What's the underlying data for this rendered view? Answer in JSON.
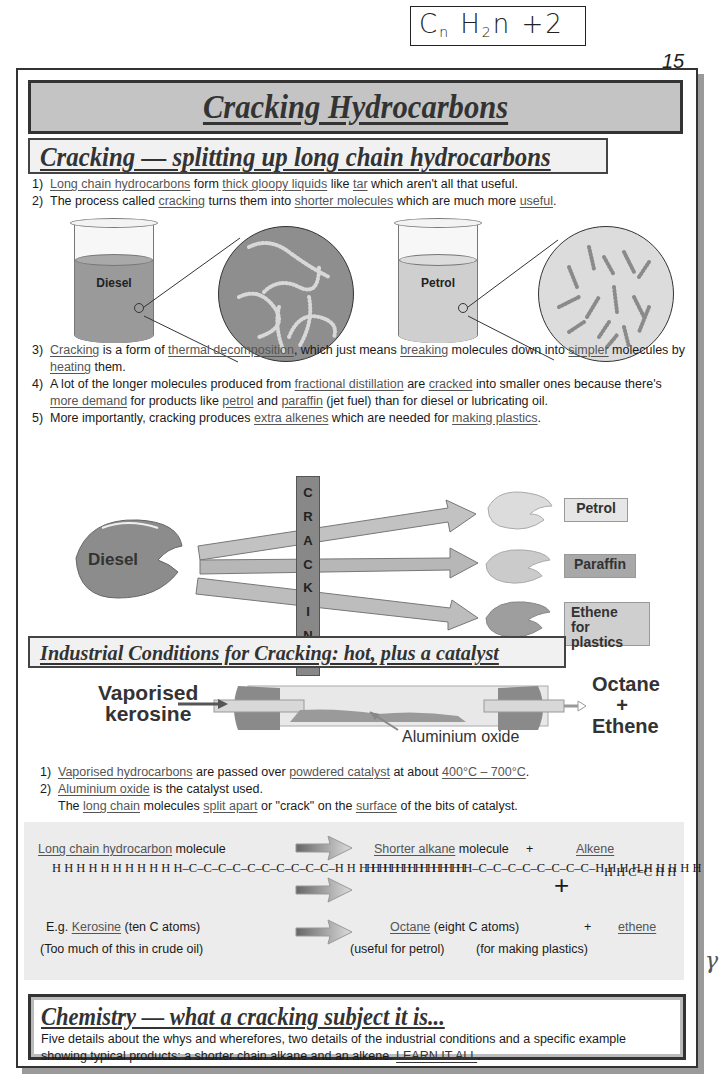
{
  "annotation": {
    "handwritten_formula": "Cn H2n + 2",
    "formula_parts": {
      "c": "C",
      "n1": "n",
      "h": "H",
      "sub": "2",
      "n2": "n",
      "plus": "+",
      "two": "2"
    }
  },
  "page_number": "15",
  "title": "Cracking Hydrocarbons",
  "section1": {
    "heading": "Cracking — splitting up long chain hydrocarbons",
    "points": [
      {
        "num": "1)",
        "parts": [
          {
            "text": "Long chain hydrocarbons",
            "u": true
          },
          {
            "text": " form ",
            "u": false
          },
          {
            "text": "thick gloopy liquids",
            "u": true
          },
          {
            "text": " like ",
            "u": false
          },
          {
            "text": "tar",
            "u": true
          },
          {
            "text": " which aren't all that useful.",
            "u": false
          }
        ]
      },
      {
        "num": "2)",
        "parts": [
          {
            "text": "The process called ",
            "u": false
          },
          {
            "text": "cracking",
            "u": true
          },
          {
            "text": " turns them into ",
            "u": false
          },
          {
            "text": "shorter molecules",
            "u": true
          },
          {
            "text": " which are much more ",
            "u": false
          },
          {
            "text": "useful",
            "u": true
          },
          {
            "text": ".",
            "u": false
          }
        ]
      }
    ],
    "beakers": [
      {
        "label": "Diesel",
        "liquid_color": "#9a9a9a",
        "magnifier_color": "#8e8e8e",
        "molecules": "long chains"
      },
      {
        "label": "Petrol",
        "liquid_color": "#cfcfcf",
        "magnifier_color": "#d9d9d9",
        "molecules": "short chains"
      }
    ],
    "points_more": [
      {
        "num": "3)",
        "parts": [
          {
            "text": "Cracking",
            "u": true
          },
          {
            "text": " is a form of ",
            "u": false
          },
          {
            "text": "thermal decomposition",
            "u": true
          },
          {
            "text": ", which just means ",
            "u": false
          },
          {
            "text": "breaking",
            "u": true
          },
          {
            "text": " molecules down into ",
            "u": false
          },
          {
            "text": "simpler",
            "u": true
          },
          {
            "text": " molecules by ",
            "u": false
          },
          {
            "text": "heating",
            "u": true
          },
          {
            "text": " them.",
            "u": false
          }
        ]
      },
      {
        "num": "4)",
        "parts": [
          {
            "text": "A lot of the longer molecules produced from ",
            "u": false
          },
          {
            "text": "fractional distillation",
            "u": true
          },
          {
            "text": " are ",
            "u": false
          },
          {
            "text": "cracked",
            "u": true
          },
          {
            "text": " into smaller ones because there's ",
            "u": false
          },
          {
            "text": "more demand",
            "u": true
          },
          {
            "text": " for products like ",
            "u": false
          },
          {
            "text": "petrol",
            "u": true
          },
          {
            "text": " and ",
            "u": false
          },
          {
            "text": "paraffin",
            "u": true
          },
          {
            "text": " (jet fuel) than for diesel or lubricating oil.",
            "u": false
          }
        ]
      },
      {
        "num": "5)",
        "parts": [
          {
            "text": "More importantly, cracking produces ",
            "u": false
          },
          {
            "text": "extra alkenes",
            "u": true
          },
          {
            "text": " which are needed for ",
            "u": false
          },
          {
            "text": "making plastics",
            "u": true
          },
          {
            "text": ".",
            "u": false
          }
        ]
      }
    ],
    "diagram": {
      "source": "Diesel",
      "process_letters": [
        "C",
        "R",
        "A",
        "C",
        "K",
        "I",
        "N",
        "G"
      ],
      "products": [
        {
          "label": "Petrol",
          "box_color": "#e6e6e6",
          "blob_color": "#d4d4d4"
        },
        {
          "label": "Paraffin",
          "box_color": "#a8a8a8",
          "blob_color": "#c4c4c4"
        },
        {
          "label": "Ethene for plastics",
          "line1": "Ethene",
          "line2": "for plastics",
          "box_color": "#cfcfcf",
          "blob_color": "#9e9e9e"
        }
      ]
    }
  },
  "section2": {
    "heading": "Industrial Conditions for Cracking: hot, plus a catalyst",
    "tube": {
      "input_line1": "Vaporised",
      "input_line2": "kerosine",
      "catalyst_label": "Aluminium oxide",
      "output_line1": "Octane",
      "output_plus": "+",
      "output_line2": "Ethene"
    },
    "points": [
      {
        "num": "1)",
        "parts": [
          {
            "text": "Vaporised hydrocarbons",
            "u": true
          },
          {
            "text": " are passed over ",
            "u": false
          },
          {
            "text": "powdered catalyst",
            "u": true
          },
          {
            "text": " at about ",
            "u": false
          },
          {
            "text": "400°C – 700°C",
            "u": true
          },
          {
            "text": ".",
            "u": false
          }
        ]
      },
      {
        "num": "2)",
        "parts": [
          {
            "text": "Aluminium oxide",
            "u": true
          },
          {
            "text": " is the catalyst used.",
            "u": false
          }
        ]
      },
      {
        "num": "",
        "parts": [
          {
            "text": "The ",
            "u": false
          },
          {
            "text": "long chain",
            "u": true
          },
          {
            "text": " molecules ",
            "u": false
          },
          {
            "text": "split apart",
            "u": true
          },
          {
            "text": " or \"crack\" on the ",
            "u": false
          },
          {
            "text": "surface",
            "u": true
          },
          {
            "text": " of the bits of catalyst.",
            "u": false
          }
        ]
      }
    ]
  },
  "equation": {
    "left_heading_u": "Long chain hydrocarbon",
    "left_heading_rest": " molecule",
    "middle_heading_u": "Shorter alkane",
    "middle_heading_rest": " molecule",
    "plus": "+",
    "right_heading_u": "Alkene",
    "decane_formula": " H  H  H  H  H  H  H  H  H  H\nH–C–C–C–C–C–C–C–C–C–C–H\n H  H  H  H  H  H  H  H  H  H",
    "octane_formula": " H  H  H  H  H  H  H  H\nH–C–C–C–C–C–C–C–C–H\n H  H  H  H  H  H  H  H",
    "ethene_formula": "H       H\n  C=C\nH       H",
    "left_example_prefix": "E.g. ",
    "left_example_u": "Kerosine",
    "left_example_rest": " (ten C atoms)",
    "left_note": "(Too much of this in crude oil)",
    "middle_example_u": "Octane",
    "middle_example_rest": " (eight C atoms)",
    "right_example_u": "ethene",
    "middle_note": "(useful for petrol)",
    "right_note": "(for making plastics)"
  },
  "summary": {
    "heading": "Chemistry — what a cracking subject it is...",
    "text": "Five details about the whys and wherefores, two details of the industrial conditions and a specific example showing typical products: a shorter chain alkane and an alkene. ",
    "emphasis": "LEARN IT ALL",
    "end": "."
  },
  "margin_mark": "γ"
}
